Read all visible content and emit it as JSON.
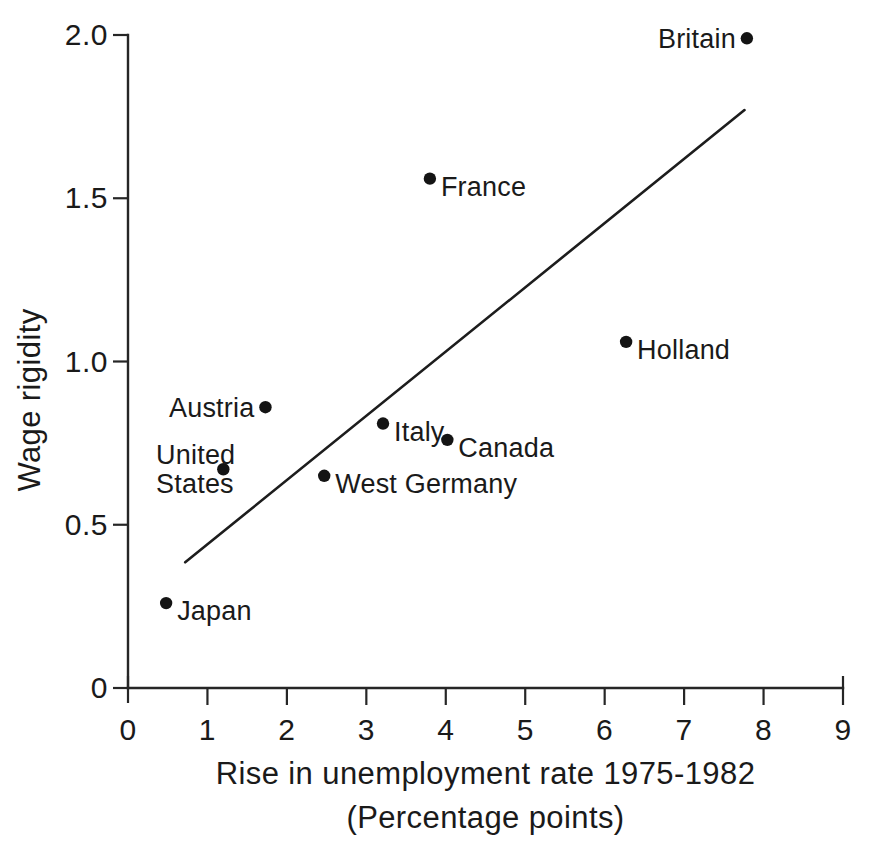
{
  "chart_data": {
    "type": "scatter",
    "title": "",
    "xlabel": "Rise in unemployment rate 1975-1982",
    "xlabel_sub": "(Percentage points)",
    "ylabel": "Wage rigidity",
    "xlim": [
      0,
      9
    ],
    "ylim": [
      0,
      2.0
    ],
    "xticks": [
      "0",
      "1",
      "2",
      "3",
      "4",
      "5",
      "6",
      "7",
      "8",
      "9"
    ],
    "xtick_values": [
      0,
      1,
      2,
      3,
      4,
      5,
      6,
      7,
      8,
      9
    ],
    "yticks": [
      "0",
      "0.5",
      "1.0",
      "1.5",
      "2.0"
    ],
    "ytick_values": [
      0,
      0.5,
      1.0,
      1.5,
      2.0
    ],
    "grid": false,
    "legend": null,
    "points": [
      {
        "label": "Japan",
        "x": 0.48,
        "y": 0.26,
        "label_pos": "right"
      },
      {
        "label": "United\nStates",
        "x": 1.2,
        "y": 0.67,
        "label_pos": "left-two-line"
      },
      {
        "label": "Austria",
        "x": 1.73,
        "y": 0.86,
        "label_pos": "left"
      },
      {
        "label": "West Germany",
        "x": 2.47,
        "y": 0.65,
        "label_pos": "right"
      },
      {
        "label": "Italy",
        "x": 3.21,
        "y": 0.81,
        "label_pos": "right"
      },
      {
        "label": "France",
        "x": 3.8,
        "y": 1.56,
        "label_pos": "right"
      },
      {
        "label": "Canada",
        "x": 4.02,
        "y": 0.76,
        "label_pos": "right"
      },
      {
        "label": "Holland",
        "x": 6.27,
        "y": 1.06,
        "label_pos": "right"
      },
      {
        "label": "Britain",
        "x": 7.79,
        "y": 1.99,
        "label_pos": "left"
      }
    ],
    "trend_line": {
      "x0": 0.72,
      "y0": 0.385,
      "x1": 7.76,
      "y1": 1.77
    },
    "colors": {
      "axis": "#262626",
      "marker": "#141414",
      "trend": "#1d1d1d",
      "text": "#1a1a1a",
      "background": "#ffffff"
    }
  }
}
